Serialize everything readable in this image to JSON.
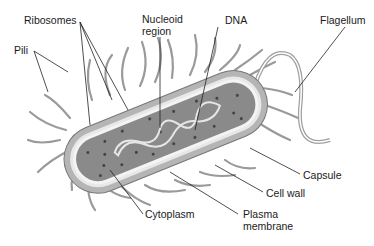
{
  "diagram": {
    "labels": {
      "ribosomes": "Ribosomes",
      "nucleoid_line1": "Nucleoid",
      "nucleoid_line2": "region",
      "dna": "DNA",
      "flagellum": "Flagellum",
      "pili": "Pili",
      "capsule": "Capsule",
      "cell_wall": "Cell wall",
      "cytoplasm": "Cytoplasm",
      "plasma_line1": "Plasma",
      "plasma_line2": "membrane"
    },
    "colors": {
      "background": "#ffffff",
      "capsule": "#b5b5b5",
      "cell_wall": "#e8e8e8",
      "cytoplasm": "#8a8a8a",
      "pili": "#9a9a9a",
      "ribosome": "#4a4a4a",
      "leader_line": "#222222",
      "text": "#1a1a1a"
    }
  }
}
